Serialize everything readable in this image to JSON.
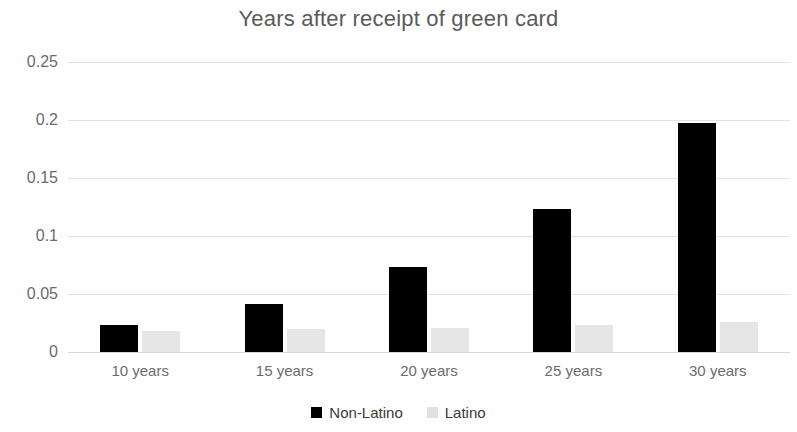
{
  "chart_data": {
    "type": "bar",
    "title": "Years after receipt of green card",
    "subtitle": "",
    "xlabel": "",
    "ylabel": "",
    "categories": [
      "10 years",
      "15 years",
      "20 years",
      "25 years",
      "30 years"
    ],
    "series": [
      {
        "name": "Non-Latino",
        "color": "#000000",
        "values": [
          0.023,
          0.041,
          0.073,
          0.123,
          0.197
        ]
      },
      {
        "name": "Latino",
        "color": "#e6e6e6",
        "values": [
          0.018,
          0.02,
          0.021,
          0.023,
          0.026
        ]
      }
    ],
    "ylim": [
      0,
      0.25
    ],
    "yticks": [
      0,
      0.05,
      0.1,
      0.15,
      0.2,
      0.25
    ],
    "ytick_labels": [
      "0",
      "0.05",
      "0.1",
      "0.15",
      "0.2",
      "0.25"
    ],
    "grid": true,
    "grid_axis": "y",
    "legend": true,
    "legend_position": "bottom",
    "background_color": "#ffffff",
    "grid_color": "#e2e2e2",
    "text_color": "#6b6b6b",
    "title_color": "#5a5a5a"
  }
}
